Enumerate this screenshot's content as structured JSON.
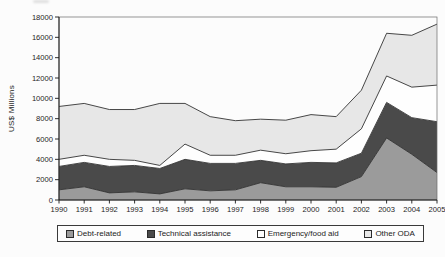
{
  "figure": {
    "background": "#fcfcfc",
    "plot_border_color": "#6a6a6a",
    "axis_color": "#1a1a1a",
    "text_color": "#1c1c1c"
  },
  "chart_data": {
    "type": "area",
    "stacked": true,
    "title": "",
    "xlabel": "",
    "ylabel": "US$ Millions",
    "x": [
      1990,
      1991,
      1992,
      1993,
      1994,
      1995,
      1996,
      1997,
      1998,
      1999,
      2000,
      2001,
      2002,
      2003,
      2004,
      2005
    ],
    "series": [
      {
        "name": "Debt-related",
        "color": "#9b9b9b",
        "values": [
          1000,
          1300,
          700,
          800,
          600,
          1100,
          900,
          1000,
          1700,
          1300,
          1300,
          1250,
          2300,
          6100,
          4500,
          2700
        ]
      },
      {
        "name": "Technical assistance",
        "color": "#4a4a4a",
        "values": [
          2300,
          2400,
          2600,
          2600,
          2500,
          2900,
          2700,
          2600,
          2200,
          2250,
          2400,
          2400,
          2300,
          3500,
          3600,
          5000
        ]
      },
      {
        "name": "Emergency/food aid",
        "color": "#fefefe",
        "values": [
          700,
          700,
          700,
          500,
          300,
          1500,
          800,
          800,
          1000,
          1000,
          1150,
          1350,
          2400,
          2600,
          3000,
          3600
        ]
      },
      {
        "name": "Other ODA",
        "color": "#e7e7e7",
        "values": [
          5200,
          5100,
          4900,
          5000,
          6100,
          4000,
          3800,
          3400,
          3050,
          3300,
          3550,
          3200,
          3800,
          4200,
          5100,
          6000
        ]
      }
    ],
    "ylim": [
      0,
      18000
    ],
    "yticks": [
      0,
      2000,
      4000,
      6000,
      8000,
      10000,
      12000,
      14000,
      16000,
      18000
    ],
    "grid": false,
    "line_color": "#333333",
    "legend_position": "bottom"
  }
}
